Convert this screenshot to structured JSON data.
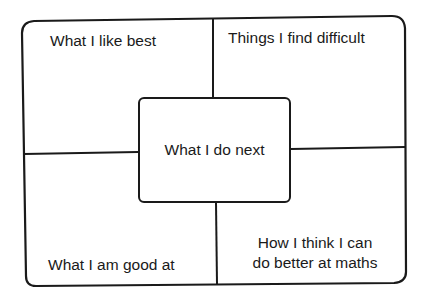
{
  "diagram": {
    "type": "four-quadrant reflection chart with central box",
    "stroke_color": "#1a1a1a",
    "background_color": "#ffffff",
    "quadrants": [
      {
        "position": "top-left",
        "label": "What I like best"
      },
      {
        "position": "top-right",
        "label": "Things I find difficult"
      },
      {
        "position": "bottom-left",
        "label": "What I am good at"
      },
      {
        "position": "bottom-right",
        "label_line1": "How I think I can",
        "label_line2": "do better at maths"
      }
    ],
    "center": {
      "label": "What I do next"
    }
  }
}
